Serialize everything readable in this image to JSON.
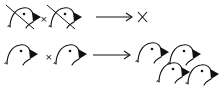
{
  "diagram": {
    "ink_color": "#111111",
    "rows": [
      {
        "id": "row-1",
        "left_parent": {
          "type": "bird",
          "crossed_out": true
        },
        "operator": "×",
        "right_parent": {
          "type": "bird",
          "crossed_out": true
        },
        "arrow": "arrow-right-icon",
        "result": {
          "type": "no-offspring",
          "symbol": "×"
        }
      },
      {
        "id": "row-2",
        "left_parent": {
          "type": "bird",
          "crossed_out": false
        },
        "operator": "×",
        "right_parent": {
          "type": "bird",
          "crossed_out": false
        },
        "arrow": "arrow-right-icon",
        "result": {
          "type": "offspring",
          "count": 4
        }
      }
    ]
  }
}
